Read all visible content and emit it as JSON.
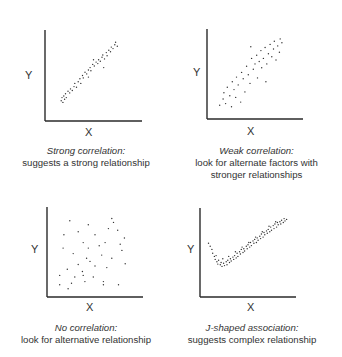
{
  "panels": [
    {
      "id": "strong",
      "axis_x_label": "X",
      "axis_y_label": "Y",
      "caption_title": "Strong correlation:",
      "caption_lines": [
        "suggests a strong relationship"
      ],
      "frame": {
        "left": 45,
        "top": 30,
        "right": 142,
        "bottom": 121
      },
      "caption_center_x": 86,
      "caption_top": 145
    },
    {
      "id": "weak",
      "axis_x_label": "X",
      "axis_y_label": "Y",
      "caption_title": "Weak correlation:",
      "caption_lines": [
        "look for alternate factors with",
        "stronger relationships"
      ],
      "frame": {
        "left": 207,
        "top": 29,
        "right": 303,
        "bottom": 119
      },
      "caption_center_x": 256,
      "caption_top": 145
    },
    {
      "id": "none",
      "axis_x_label": "X",
      "axis_y_label": "Y",
      "caption_title": "No correlation:",
      "caption_lines": [
        "look for alternative relationship"
      ],
      "frame": {
        "left": 47,
        "top": 207,
        "right": 143,
        "bottom": 297
      },
      "caption_center_x": 86,
      "caption_top": 322
    },
    {
      "id": "jshaped",
      "axis_x_label": "X",
      "axis_y_label": "Y",
      "caption_title": "J-shaped association:",
      "caption_lines": [
        "suggests complex relationship"
      ],
      "frame": {
        "left": 200,
        "top": 208,
        "right": 296,
        "bottom": 297
      },
      "caption_center_x": 251,
      "caption_top": 322
    }
  ],
  "chart_data": [
    {
      "type": "scatter",
      "title": "Strong correlation:",
      "subtitle": "suggests a strong relationship",
      "xlabel": "X",
      "ylabel": "Y",
      "grid": false,
      "legend": false,
      "xlim": [
        0,
        100
      ],
      "ylim": [
        0,
        100
      ],
      "points": [
        [
          12,
          18
        ],
        [
          13,
          22
        ],
        [
          14,
          16
        ],
        [
          15,
          24
        ],
        [
          16,
          20
        ],
        [
          17,
          27
        ],
        [
          18,
          22
        ],
        [
          20,
          30
        ],
        [
          22,
          28
        ],
        [
          23,
          33
        ],
        [
          25,
          31
        ],
        [
          27,
          36
        ],
        [
          28,
          40
        ],
        [
          30,
          35
        ],
        [
          32,
          42
        ],
        [
          34,
          46
        ],
        [
          35,
          40
        ],
        [
          37,
          50
        ],
        [
          38,
          47
        ],
        [
          40,
          54
        ],
        [
          42,
          52
        ],
        [
          44,
          57
        ],
        [
          46,
          60
        ],
        [
          47,
          56
        ],
        [
          49,
          64
        ],
        [
          51,
          62
        ],
        [
          53,
          67
        ],
        [
          55,
          65
        ],
        [
          56,
          70
        ],
        [
          58,
          68
        ],
        [
          60,
          73
        ],
        [
          61,
          76
        ],
        [
          63,
          71
        ],
        [
          65,
          79
        ],
        [
          66,
          75
        ],
        [
          68,
          82
        ],
        [
          70,
          80
        ],
        [
          71,
          86
        ],
        [
          73,
          84
        ],
        [
          75,
          89
        ],
        [
          76,
          92
        ],
        [
          78,
          87
        ],
        [
          62,
          60
        ],
        [
          50,
          70
        ],
        [
          44,
          48
        ]
      ]
    },
    {
      "type": "scatter",
      "title": "Weak correlation:",
      "subtitle": "look for alternate factors with stronger relationships",
      "xlabel": "X",
      "ylabel": "Y",
      "grid": false,
      "legend": false,
      "xlim": [
        0,
        100
      ],
      "ylim": [
        0,
        100
      ],
      "points": [
        [
          8,
          10
        ],
        [
          12,
          18
        ],
        [
          13,
          26
        ],
        [
          15,
          12
        ],
        [
          17,
          33
        ],
        [
          20,
          22
        ],
        [
          22,
          8
        ],
        [
          23,
          40
        ],
        [
          25,
          30
        ],
        [
          27,
          20
        ],
        [
          28,
          46
        ],
        [
          30,
          36
        ],
        [
          33,
          14
        ],
        [
          34,
          52
        ],
        [
          36,
          44
        ],
        [
          38,
          27
        ],
        [
          40,
          60
        ],
        [
          42,
          49
        ],
        [
          44,
          38
        ],
        [
          46,
          70
        ],
        [
          48,
          56
        ],
        [
          50,
          63
        ],
        [
          52,
          74
        ],
        [
          53,
          45
        ],
        [
          55,
          66
        ],
        [
          57,
          80
        ],
        [
          58,
          58
        ],
        [
          60,
          70
        ],
        [
          62,
          84
        ],
        [
          64,
          63
        ],
        [
          66,
          76
        ],
        [
          68,
          88
        ],
        [
          70,
          72
        ],
        [
          72,
          82
        ],
        [
          73,
          92
        ],
        [
          75,
          68
        ],
        [
          77,
          86
        ],
        [
          79,
          78
        ],
        [
          80,
          95
        ],
        [
          82,
          90
        ],
        [
          63,
          40
        ],
        [
          45,
          85
        ]
      ]
    },
    {
      "type": "scatter",
      "title": "No correlation:",
      "subtitle": "look for alternative relationship",
      "xlabel": "X",
      "ylabel": "Y",
      "grid": false,
      "legend": false,
      "xlim": [
        0,
        100
      ],
      "ylim": [
        0,
        100
      ],
      "points": [
        [
          20,
          90
        ],
        [
          42,
          85
        ],
        [
          70,
          93
        ],
        [
          72,
          88
        ],
        [
          66,
          80
        ],
        [
          77,
          78
        ],
        [
          13,
          72
        ],
        [
          30,
          76
        ],
        [
          50,
          72
        ],
        [
          85,
          68
        ],
        [
          62,
          62
        ],
        [
          36,
          62
        ],
        [
          55,
          58
        ],
        [
          12,
          55
        ],
        [
          42,
          55
        ],
        [
          80,
          60
        ],
        [
          24,
          48
        ],
        [
          40,
          42
        ],
        [
          58,
          46
        ],
        [
          70,
          42
        ],
        [
          86,
          35
        ],
        [
          30,
          34
        ],
        [
          50,
          32
        ],
        [
          64,
          30
        ],
        [
          17,
          28
        ],
        [
          35,
          25
        ],
        [
          8,
          20
        ],
        [
          48,
          18
        ],
        [
          26,
          18
        ],
        [
          38,
          12
        ],
        [
          60,
          12
        ],
        [
          60,
          8
        ],
        [
          78,
          8
        ],
        [
          8,
          8
        ],
        [
          22,
          10
        ],
        [
          18,
          3
        ],
        [
          82,
          52
        ],
        [
          44,
          38
        ],
        [
          36,
          20
        ]
      ]
    },
    {
      "type": "scatter",
      "title": "J-shaped association:",
      "subtitle": "suggests complex relationship",
      "xlabel": "X",
      "ylabel": "Y",
      "grid": false,
      "legend": false,
      "xlim": [
        0,
        100
      ],
      "ylim": [
        0,
        100
      ],
      "points": [
        [
          3,
          62
        ],
        [
          5,
          58
        ],
        [
          7,
          54
        ],
        [
          8,
          49
        ],
        [
          10,
          45
        ],
        [
          11,
          41
        ],
        [
          13,
          38
        ],
        [
          14,
          35
        ],
        [
          15,
          40
        ],
        [
          17,
          34
        ],
        [
          18,
          37
        ],
        [
          19,
          32
        ],
        [
          21,
          36
        ],
        [
          22,
          33
        ],
        [
          24,
          38
        ],
        [
          25,
          34
        ],
        [
          26,
          40
        ],
        [
          28,
          37
        ],
        [
          29,
          42
        ],
        [
          30,
          39
        ],
        [
          32,
          44
        ],
        [
          33,
          41
        ],
        [
          34,
          46
        ],
        [
          36,
          43
        ],
        [
          37,
          49
        ],
        [
          38,
          45
        ],
        [
          40,
          51
        ],
        [
          41,
          48
        ],
        [
          42,
          54
        ],
        [
          44,
          50
        ],
        [
          45,
          55
        ],
        [
          46,
          52
        ],
        [
          48,
          58
        ],
        [
          49,
          55
        ],
        [
          50,
          60
        ],
        [
          52,
          57
        ],
        [
          53,
          63
        ],
        [
          54,
          59
        ],
        [
          56,
          65
        ],
        [
          57,
          62
        ],
        [
          58,
          67
        ],
        [
          60,
          63
        ],
        [
          61,
          69
        ],
        [
          62,
          66
        ],
        [
          64,
          71
        ],
        [
          65,
          68
        ],
        [
          66,
          74
        ],
        [
          68,
          70
        ],
        [
          69,
          76
        ],
        [
          70,
          73
        ],
        [
          72,
          78
        ],
        [
          73,
          75
        ],
        [
          74,
          80
        ],
        [
          76,
          77
        ],
        [
          77,
          83
        ],
        [
          78,
          79
        ],
        [
          80,
          85
        ],
        [
          81,
          81
        ],
        [
          82,
          87
        ],
        [
          84,
          83
        ],
        [
          85,
          89
        ],
        [
          86,
          86
        ],
        [
          88,
          90
        ],
        [
          89,
          87
        ],
        [
          90,
          92
        ],
        [
          92,
          89
        ],
        [
          93,
          94
        ],
        [
          94,
          91
        ],
        [
          96,
          93
        ],
        [
          12,
          46
        ],
        [
          20,
          42
        ],
        [
          27,
          45
        ],
        [
          35,
          51
        ],
        [
          43,
          57
        ],
        [
          51,
          63
        ],
        [
          59,
          70
        ],
        [
          67,
          77
        ],
        [
          75,
          84
        ],
        [
          83,
          90
        ]
      ]
    }
  ]
}
